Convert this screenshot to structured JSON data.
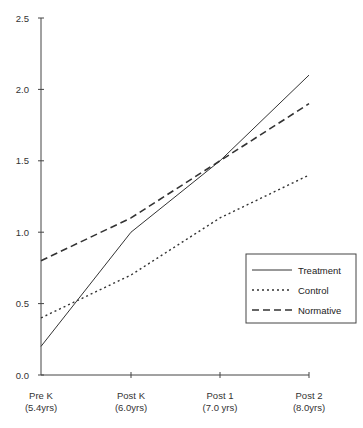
{
  "chart_data": {
    "type": "line",
    "title": "",
    "xlabel": "",
    "ylabel": "",
    "categories": [
      "Pre K (5.4yrs)",
      "Post K (6.0yrs)",
      "Post 1 (7.0 yrs)",
      "Post 2 (8.0yrs)"
    ],
    "x_tick_labels": [
      {
        "line1": "Pre K",
        "line2": "(5.4yrs)"
      },
      {
        "line1": "Post K",
        "line2": "(6.0yrs)"
      },
      {
        "line1": "Post 1",
        "line2": "(7.0  yrs)"
      },
      {
        "line1": "Post 2",
        "line2": "(8.0yrs)"
      }
    ],
    "y_ticks": [
      "0.0",
      "0.5",
      "1.0",
      "1.5",
      "2.0",
      "2.5"
    ],
    "ylim": [
      0,
      2.5
    ],
    "grid": false,
    "legend_position": "lower right",
    "series": [
      {
        "name": "Treatment",
        "style": "solid",
        "values": [
          0.2,
          1.0,
          1.5,
          2.1
        ]
      },
      {
        "name": "Control",
        "style": "dotted",
        "values": [
          0.4,
          0.7,
          1.1,
          1.4
        ]
      },
      {
        "name": "Normative",
        "style": "dashed",
        "values": [
          0.8,
          1.1,
          1.5,
          1.9
        ]
      }
    ]
  },
  "colors": {
    "line": "#333333",
    "axis": "#444444",
    "background": "#ffffff"
  }
}
